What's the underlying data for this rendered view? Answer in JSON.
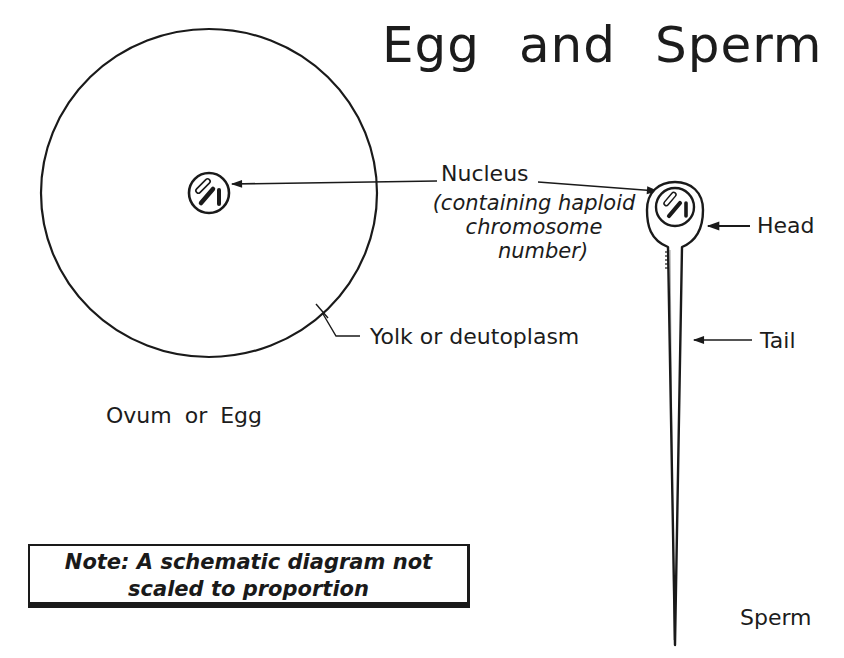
{
  "title": "Egg and Sperm",
  "egg": {
    "caption": "Ovum or Egg",
    "yolk_label": "Yolk or deutoplasm",
    "circle": {
      "cx": 209,
      "cy": 193,
      "rx": 168,
      "ry": 164
    },
    "nucleus": {
      "cx": 209,
      "cy": 193,
      "r": 21
    }
  },
  "nucleus_callout": {
    "label": "Nucleus",
    "description_lines": [
      "(containing haploid",
      "chromosome",
      "number)"
    ]
  },
  "sperm": {
    "caption": "Sperm",
    "head_label": "Head",
    "tail_label": "Tail",
    "nucleus": {
      "cx": 675,
      "cy": 207,
      "r": 20
    }
  },
  "note": {
    "lines": [
      "Note:  A schematic diagram not",
      "scaled to proportion"
    ]
  },
  "colors": {
    "ink": "#1a1a1a",
    "background": "#ffffff"
  }
}
